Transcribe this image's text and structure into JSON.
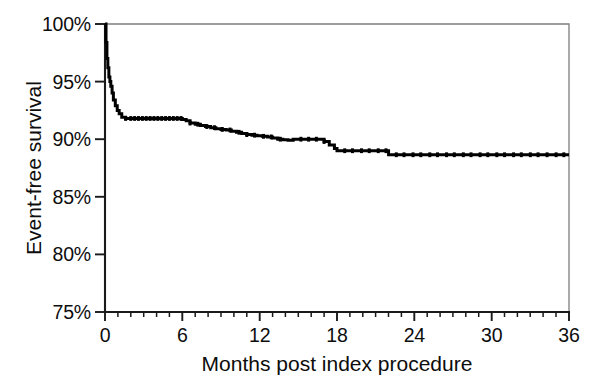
{
  "figure": {
    "background_color": "#ffffff",
    "ink_color": "#000000",
    "frame_color": "#7d7d7d"
  },
  "chart_data": {
    "type": "line",
    "subtype": "kaplan-meier-step",
    "title": "",
    "subtitle": "",
    "xlabel": "Months post index procedure",
    "ylabel": "Event-free survival",
    "xlim": [
      0,
      36
    ],
    "ylim": [
      75,
      100
    ],
    "grid": false,
    "legend": null,
    "legend_position": "none",
    "x_ticks": [
      0,
      6,
      12,
      18,
      24,
      30,
      36
    ],
    "x_tick_labels": [
      "0",
      "6",
      "12",
      "18",
      "24",
      "30",
      "36"
    ],
    "x_minor_tick_interval": 1,
    "y_ticks": [
      75,
      80,
      85,
      90,
      95,
      100
    ],
    "y_tick_labels": [
      "75%",
      "80%",
      "85%",
      "90%",
      "95%",
      "100%"
    ],
    "y_unit": "%",
    "series": [
      {
        "name": "Event-free survival",
        "color": "#000000",
        "x": [
          0.0,
          0.08,
          0.15,
          0.22,
          0.3,
          0.38,
          0.45,
          0.55,
          0.65,
          0.8,
          0.95,
          1.1,
          1.3,
          1.6,
          2.0,
          2.5,
          3.0,
          3.5,
          4.0,
          4.5,
          5.0,
          5.5,
          6.0,
          6.3,
          6.6,
          7.0,
          7.4,
          7.8,
          8.2,
          8.6,
          9.0,
          9.4,
          9.8,
          10.2,
          10.6,
          11.0,
          11.4,
          11.8,
          12.2,
          12.6,
          13.0,
          13.4,
          13.8,
          14.2,
          14.6,
          15.0,
          15.5,
          16.0,
          16.5,
          17.0,
          17.4,
          17.8,
          18.0,
          18.5,
          19.0,
          19.5,
          20.0,
          20.5,
          21.0,
          21.5,
          22.0,
          22.5,
          23.0,
          24.0,
          25.0,
          26.0,
          27.0,
          28.0,
          29.0,
          30.0,
          31.0,
          32.0,
          33.0,
          34.0,
          35.0,
          36.0
        ],
        "y": [
          100.0,
          98.4,
          97.0,
          96.2,
          95.4,
          95.0,
          94.6,
          94.0,
          93.4,
          92.9,
          92.5,
          92.2,
          91.9,
          91.8,
          91.8,
          91.8,
          91.8,
          91.8,
          91.8,
          91.8,
          91.8,
          91.8,
          91.7,
          91.6,
          91.4,
          91.3,
          91.2,
          91.1,
          91.0,
          90.9,
          90.85,
          90.8,
          90.7,
          90.6,
          90.5,
          90.4,
          90.35,
          90.3,
          90.25,
          90.2,
          90.1,
          90.0,
          89.95,
          89.9,
          90.0,
          90.0,
          90.0,
          90.0,
          90.0,
          89.8,
          89.5,
          89.2,
          89.0,
          89.0,
          89.0,
          89.0,
          89.0,
          89.0,
          89.0,
          89.0,
          88.65,
          88.65,
          88.65,
          88.65,
          88.65,
          88.65,
          88.65,
          88.65,
          88.65,
          88.65,
          88.65,
          88.65,
          88.65,
          88.65,
          88.65,
          88.65
        ],
        "start_value": 100.0,
        "end_value": 88.65,
        "plateau_after_month": 22,
        "key_steps": [
          {
            "month": 0.0,
            "survival": 100.0,
            "note": "baseline"
          },
          {
            "month": 1.3,
            "survival": 91.9,
            "note": "early steep drop"
          },
          {
            "month": 6.0,
            "survival": 91.8,
            "note": "first plateau end"
          },
          {
            "month": 12.0,
            "survival": 90.4,
            "note": "one year"
          },
          {
            "month": 14.0,
            "survival": 90.0,
            "note": "mid plateau"
          },
          {
            "month": 18.0,
            "survival": 89.0,
            "note": "step down"
          },
          {
            "month": 22.0,
            "survival": 88.65,
            "note": "final step"
          },
          {
            "month": 36.0,
            "survival": 88.65,
            "note": "three year endpoint"
          }
        ]
      }
    ],
    "censoring_months": [
      1.6,
      2.0,
      2.3,
      2.6,
      2.9,
      3.2,
      3.5,
      3.8,
      4.1,
      4.4,
      4.7,
      5.0,
      5.3,
      5.6,
      5.9,
      6.6,
      7.2,
      7.9,
      8.5,
      9.1,
      9.7,
      10.4,
      11.0,
      11.6,
      12.3,
      12.9,
      13.6,
      15.2,
      15.8,
      16.4,
      17.0,
      18.6,
      19.2,
      19.9,
      20.5,
      21.2,
      21.8,
      22.6,
      23.2,
      23.9,
      24.5,
      25.2,
      25.8,
      26.5,
      27.1,
      27.8,
      28.4,
      29.1,
      29.7,
      30.4,
      31.0,
      31.7,
      32.3,
      33.0,
      33.6,
      34.3,
      35.0,
      35.6
    ]
  }
}
